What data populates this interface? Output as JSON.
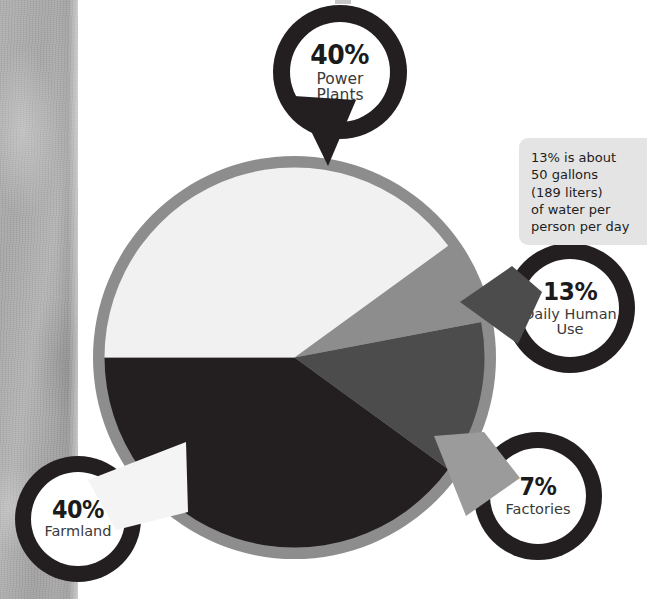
{
  "chart_data": {
    "type": "pie",
    "title": "",
    "categories": [
      "Power Plants",
      "Daily Human Use",
      "Factories",
      "Farmland"
    ],
    "values": [
      40,
      13,
      7,
      40
    ],
    "value_suffix": "%",
    "colors": [
      "#231f20",
      "#4c4c4c",
      "#8d8d8d",
      "#f1f1f1"
    ],
    "ring_color": "#8d8d8d",
    "legend": "callout-badges",
    "legend_position": "around-pie",
    "annotations": [
      "13% is about\n50 gallons\n(189 liters)\nof water per\nperson per day"
    ],
    "slices": [
      {
        "label": "Power Plants",
        "value": 40,
        "display": "40%",
        "color": "#231f20"
      },
      {
        "label": "Daily Human Use",
        "value": 13,
        "display": "13%",
        "color": "#4c4c4c"
      },
      {
        "label": "Factories",
        "value": 7,
        "display": "7%",
        "color": "#8d8d8d"
      },
      {
        "label": "Farmland",
        "value": 40,
        "display": "40%",
        "color": "#f1f1f1"
      }
    ]
  },
  "badges": {
    "power_plants": {
      "percent": "40%",
      "label": "Power\nPlants",
      "ring_color": "#231f20"
    },
    "daily_human": {
      "percent": "13%",
      "label": "Daily Human\nUse",
      "ring_color": "#231f20"
    },
    "factories": {
      "percent": "7%",
      "label": "Factories",
      "ring_color": "#231f20"
    },
    "farmland": {
      "percent": "40%",
      "label": "Farmland",
      "ring_color": "#231f20"
    }
  },
  "note": {
    "text": "13% is about\n50 gallons\n(189 liters)\nof water per\nperson per day",
    "background": "#e4e4e4"
  },
  "colors": {
    "black": "#231f20",
    "dark_gray": "#4c4c4c",
    "mid_gray": "#8d8d8d",
    "off_white": "#f1f1f1",
    "paper_gray": "#b0b0b0",
    "page_background": "#ffffff"
  }
}
